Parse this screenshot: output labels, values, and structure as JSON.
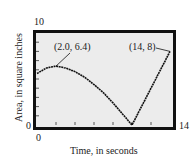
{
  "chart_data": {
    "type": "line",
    "title": "",
    "xlabel": "Time, in seconds",
    "ylabel": "Area, in square inches",
    "xlim": [
      0,
      14
    ],
    "ylim": [
      0,
      10
    ],
    "x_ticks_step": 2,
    "y_ticks_step": 1,
    "grid": false,
    "window_labels": {
      "x_min": "0",
      "x_max": "14",
      "y_min": "0",
      "y_max": "10"
    },
    "series": [
      {
        "name": "Area",
        "x": [
          0,
          1,
          2,
          3,
          4,
          5,
          6,
          7,
          8,
          9,
          10,
          11,
          12,
          13,
          14
        ],
        "y": [
          5.6,
          6.2,
          6.4,
          6.2,
          5.8,
          5.2,
          4.4,
          3.5,
          2.4,
          1.2,
          0,
          2.0,
          4.0,
          6.0,
          8.0
        ]
      }
    ],
    "annotations": [
      {
        "text": "(2.0, 6.4)",
        "x": 2.0,
        "y": 6.4
      },
      {
        "text": "(14, 8)",
        "x": 14,
        "y": 8
      }
    ]
  },
  "labels": {
    "y_max": "10",
    "y_min": "0",
    "x_min": "0",
    "x_max": "14",
    "xlabel": "Time, in seconds",
    "ylabel": "Area, in square inches",
    "annotation_peak": "(2.0, 6.4)",
    "annotation_end": "(14, 8)"
  },
  "colors": {
    "frame": "#111111",
    "plot_bg": "#ececec",
    "curve": "#111111"
  }
}
